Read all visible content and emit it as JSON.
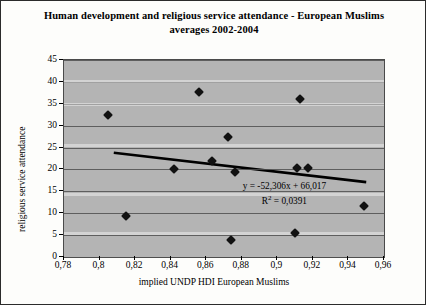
{
  "chart_data": {
    "type": "scatter",
    "title": "Human development and religious service attendance - European Muslims averages 2002-2004",
    "title_lines": [
      "Human development and religious service attendance - European Muslims",
      "averages 2002-2004"
    ],
    "xlabel": "implied UNDP HDI European Muslims",
    "ylabel": "religious service attendance",
    "xlim": [
      0.78,
      0.96
    ],
    "ylim": [
      0,
      45
    ],
    "xticks": [
      0.78,
      0.8,
      0.82,
      0.84,
      0.86,
      0.88,
      0.9,
      0.92,
      0.94,
      0.96
    ],
    "xtick_labels": [
      "0,78",
      "0,8",
      "0,82",
      "0,84",
      "0,86",
      "0,88",
      "0,9",
      "0,92",
      "0,94",
      "0,96"
    ],
    "yticks": [
      0,
      5,
      10,
      15,
      20,
      25,
      30,
      35,
      40,
      45
    ],
    "ytick_labels": [
      "0",
      "5",
      "10",
      "15",
      "20",
      "25",
      "30",
      "35",
      "40",
      "45"
    ],
    "grid": true,
    "grid_axis": "y",
    "legend": false,
    "plot_background": "#b4b4b4",
    "marker_color": "#111111",
    "marker_shape": "diamond",
    "points": [
      {
        "x": 0.805,
        "y": 32.5
      },
      {
        "x": 0.815,
        "y": 9.3
      },
      {
        "x": 0.842,
        "y": 20.2
      },
      {
        "x": 0.856,
        "y": 37.8
      },
      {
        "x": 0.863,
        "y": 22.0
      },
      {
        "x": 0.872,
        "y": 27.5
      },
      {
        "x": 0.874,
        "y": 3.9
      },
      {
        "x": 0.876,
        "y": 19.5
      },
      {
        "x": 0.911,
        "y": 20.3
      },
      {
        "x": 0.913,
        "y": 36.0
      },
      {
        "x": 0.917,
        "y": 20.4
      },
      {
        "x": 0.91,
        "y": 5.4
      },
      {
        "x": 0.949,
        "y": 11.6
      }
    ],
    "trendline": {
      "equation": "y = -52,306x + 66,017",
      "r_squared_label": "R",
      "r_squared_exp": "2",
      "r_squared_value": " = 0,0391",
      "slope": -52.306,
      "intercept": 66.017,
      "r2": 0.0391,
      "x_start": 0.808,
      "y_start": 23.8,
      "x_end": 0.95,
      "y_end": 17.1,
      "color": "#000000"
    }
  }
}
